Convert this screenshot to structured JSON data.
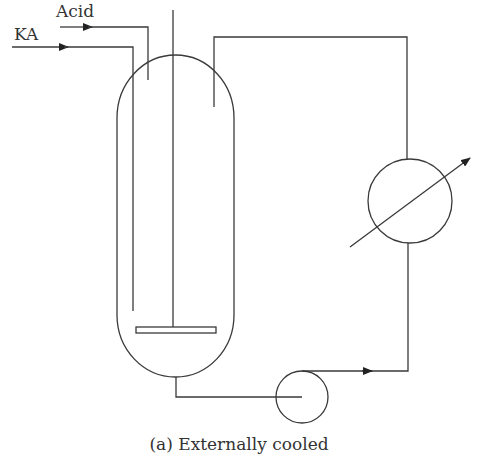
{
  "diagram": {
    "type": "process-flow",
    "caption": "(a) Externally cooled",
    "inputs": [
      {
        "label": "Acid"
      },
      {
        "label": "KA"
      }
    ],
    "components": [
      {
        "name": "reactor-vessel",
        "kind": "vessel"
      },
      {
        "name": "agitator",
        "kind": "stirrer"
      },
      {
        "name": "heat-exchanger",
        "kind": "cooler"
      },
      {
        "name": "circulation-pump",
        "kind": "pump"
      }
    ],
    "colors": {
      "line": "#3a3a3a",
      "text": "#333333",
      "background": "#ffffff"
    }
  }
}
